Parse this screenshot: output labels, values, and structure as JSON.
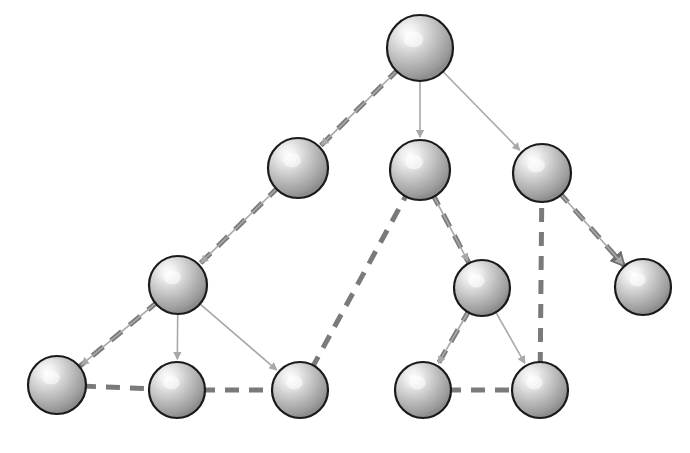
{
  "figure": {
    "type": "diagram",
    "background_color": "#ffffff",
    "caption_fragment": ""
  },
  "style": {
    "node_fill_light": "#f2f2f2",
    "node_fill_mid": "#b4b4b4",
    "node_fill_dark": "#8f8f8f",
    "node_stroke": "#1a1a1a",
    "tree_edge_color": "#a8a8a8",
    "path_edge_color": "#7a7a7a",
    "tree_edge_width": "1.6",
    "path_edge_width": "5",
    "path_dash": "14 10"
  },
  "graph": {
    "node_count": 13,
    "nodes": [
      {
        "id": "n0",
        "label": "",
        "cx": 420,
        "cy": 48,
        "r": 33,
        "level": 0
      },
      {
        "id": "n1",
        "label": "",
        "cx": 298,
        "cy": 168,
        "r": 30,
        "level": 1
      },
      {
        "id": "n2",
        "label": "",
        "cx": 420,
        "cy": 170,
        "r": 30,
        "level": 1
      },
      {
        "id": "n3",
        "label": "",
        "cx": 542,
        "cy": 173,
        "r": 29,
        "level": 1
      },
      {
        "id": "n4",
        "label": "",
        "cx": 178,
        "cy": 285,
        "r": 29,
        "level": 2
      },
      {
        "id": "n5",
        "label": "",
        "cx": 482,
        "cy": 288,
        "r": 28,
        "level": 2
      },
      {
        "id": "n6",
        "label": "",
        "cx": 643,
        "cy": 287,
        "r": 28,
        "level": 2
      },
      {
        "id": "n7",
        "label": "",
        "cx": 57,
        "cy": 385,
        "r": 29,
        "level": 3
      },
      {
        "id": "n8",
        "label": "",
        "cx": 177,
        "cy": 390,
        "r": 28,
        "level": 3
      },
      {
        "id": "n9",
        "label": "",
        "cx": 300,
        "cy": 390,
        "r": 28,
        "level": 3
      },
      {
        "id": "n10",
        "label": "",
        "cx": 423,
        "cy": 390,
        "r": 28,
        "level": 3
      },
      {
        "id": "n11",
        "label": "",
        "cx": 540,
        "cy": 390,
        "r": 28,
        "level": 3
      }
    ],
    "tree_edges": [
      {
        "from": "n0",
        "to": "n1",
        "arrow": true
      },
      {
        "from": "n0",
        "to": "n2",
        "arrow": true
      },
      {
        "from": "n0",
        "to": "n3",
        "arrow": true
      },
      {
        "from": "n1",
        "to": "n4",
        "arrow": true
      },
      {
        "from": "n2",
        "to": "n5",
        "arrow": true
      },
      {
        "from": "n3",
        "to": "n6",
        "arrow": true
      },
      {
        "from": "n4",
        "to": "n7",
        "arrow": true
      },
      {
        "from": "n4",
        "to": "n8",
        "arrow": true
      },
      {
        "from": "n4",
        "to": "n9",
        "arrow": true
      },
      {
        "from": "n5",
        "to": "n10",
        "arrow": true
      },
      {
        "from": "n5",
        "to": "n11",
        "arrow": true
      }
    ],
    "path_edges": [
      {
        "from": "n0",
        "to": "n1",
        "arrow": false
      },
      {
        "from": "n1",
        "to": "n4",
        "arrow": false
      },
      {
        "from": "n4",
        "to": "n7",
        "arrow": false
      },
      {
        "from": "n7",
        "to": "n8",
        "arrow": false
      },
      {
        "from": "n8",
        "to": "n9",
        "arrow": false
      },
      {
        "from": "n9",
        "to": "n2",
        "arrow": false
      },
      {
        "from": "n2",
        "to": "n5",
        "arrow": false
      },
      {
        "from": "n5",
        "to": "n10",
        "arrow": false
      },
      {
        "from": "n10",
        "to": "n11",
        "arrow": false
      },
      {
        "from": "n11",
        "to": "n3",
        "arrow": false
      },
      {
        "from": "n3",
        "to": "n6",
        "arrow": true
      }
    ]
  }
}
